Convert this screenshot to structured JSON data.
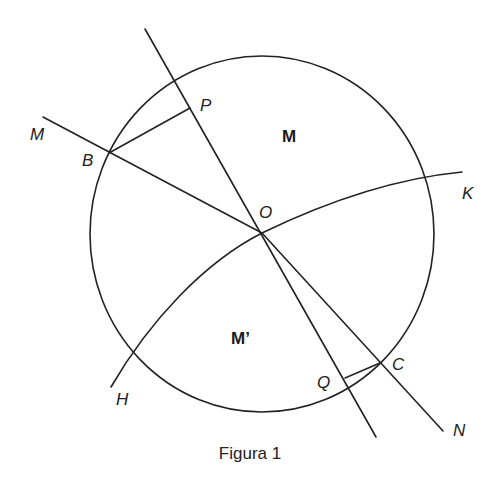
{
  "figure": {
    "caption": "Figura 1",
    "stroke_color": "#222222",
    "background": "#ffffff",
    "circle": {
      "cx": 262,
      "cy": 234,
      "rx": 172,
      "ry": 178
    },
    "lines": [
      {
        "name": "line-PQ",
        "x1": 145,
        "y1": 29,
        "x2": 376,
        "y2": 437
      },
      {
        "name": "ray-OM",
        "x1": 43,
        "y1": 117,
        "x2": 262,
        "y2": 233
      },
      {
        "name": "ray-ON",
        "x1": 262,
        "y1": 233,
        "x2": 443,
        "y2": 431
      },
      {
        "name": "segment-BP",
        "x1": 109,
        "y1": 153,
        "x2": 190,
        "y2": 108
      },
      {
        "name": "segment-CQ",
        "x1": 380,
        "y1": 363,
        "x2": 345,
        "y2": 378
      }
    ],
    "curve_HK": "M 111 387 C 150 320, 205 262, 262 233 C 330 200, 400 178, 462 172",
    "point_labels": [
      {
        "name": "label-M",
        "text": "M",
        "x": 30,
        "y": 140
      },
      {
        "name": "label-B",
        "text": "B",
        "x": 82,
        "y": 166
      },
      {
        "name": "label-P",
        "text": "P",
        "x": 200,
        "y": 111
      },
      {
        "name": "label-O",
        "text": "O",
        "x": 259,
        "y": 218
      },
      {
        "name": "label-K",
        "text": "K",
        "x": 462,
        "y": 199
      },
      {
        "name": "label-H",
        "text": "H",
        "x": 116,
        "y": 405
      },
      {
        "name": "label-Q",
        "text": "Q",
        "x": 317,
        "y": 388
      },
      {
        "name": "label-C",
        "text": "C",
        "x": 392,
        "y": 370
      },
      {
        "name": "label-N",
        "text": "N",
        "x": 453,
        "y": 436
      }
    ],
    "region_labels": [
      {
        "name": "region-M",
        "text": "M",
        "x": 282,
        "y": 142
      },
      {
        "name": "region-M-prime",
        "text": "M’",
        "x": 231,
        "y": 344
      }
    ],
    "caption_pos": {
      "x": 250,
      "y": 459
    }
  }
}
